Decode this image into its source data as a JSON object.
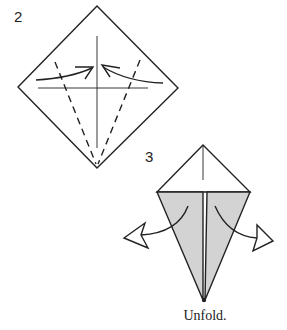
{
  "steps": [
    {
      "number": "2",
      "description": "Fold edges to center crease (kite fold)"
    },
    {
      "number": "3",
      "description": "Unfold"
    }
  ],
  "caption": "Unfold.",
  "colors": {
    "line": "#222222",
    "shaded_flap": "#d3d3d3",
    "background": "#ffffff"
  }
}
